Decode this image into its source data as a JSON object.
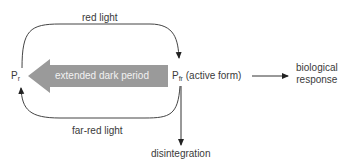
{
  "diagram": {
    "top_label": "red light",
    "bottom_label": "far-red light",
    "arrow_label": "extended dark period",
    "pr": {
      "main": "P",
      "sub": "r"
    },
    "pfr": {
      "main": "P",
      "sub": "fr",
      "suffix": "(active form)"
    },
    "response_line1": "biological",
    "response_line2": "response",
    "disintegration": "disintegration",
    "colors": {
      "arrow_fill": "#9a9a9a",
      "line": "#333333",
      "arrow_text": "#f2f2f2"
    }
  }
}
